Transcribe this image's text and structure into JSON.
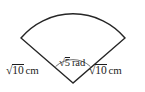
{
  "figure": {
    "name": "circular-sector-diagram",
    "shape": "circular sector",
    "stroke_color": "#262626",
    "background_color": "#ffffff",
    "labels": {
      "left_radius": {
        "radical_sign": "√",
        "radicand": "10",
        "unit": "cm",
        "full_text": "√10 cm"
      },
      "right_radius": {
        "radical_sign": "√",
        "radicand": "10",
        "unit": "cm",
        "full_text": "√10 cm"
      },
      "center_angle": {
        "radical_sign": "√",
        "radicand": "5",
        "unit": "rad",
        "full_text": "√5 rad"
      }
    },
    "geometry": {
      "vertex": [
        73,
        83
      ],
      "left_arc_endpoint": [
        21,
        38
      ],
      "right_arc_endpoint": [
        125,
        38
      ],
      "arc_apex": [
        73,
        6
      ],
      "angle_marker_arc_radius": 26
    }
  }
}
